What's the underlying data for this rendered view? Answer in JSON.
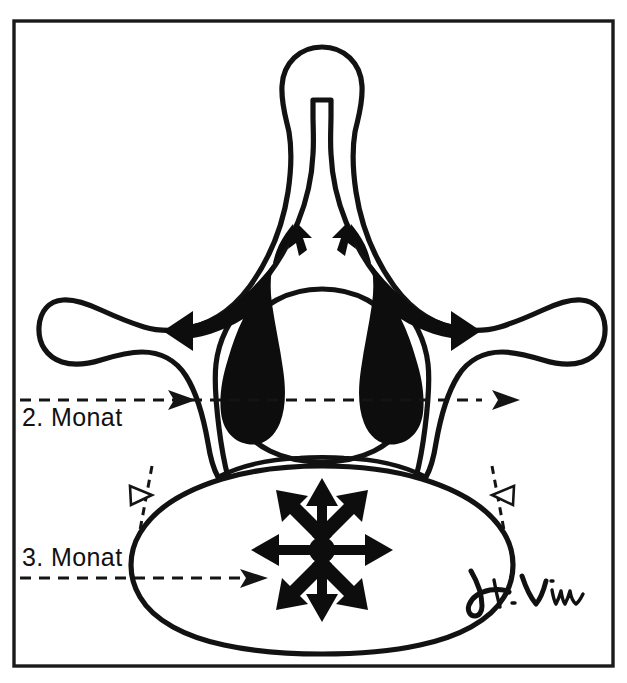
{
  "figure": {
    "type": "anatomical-line-drawing",
    "frame": {
      "visible": true,
      "color": "#1a1a1a"
    },
    "background_color": "#ffffff",
    "ink_color": "#0d0d0d"
  },
  "annotations": [
    {
      "id": "label-2-monat",
      "text": "2. Monat",
      "text_x": 22,
      "text_y": 418,
      "leader": {
        "style": "dashed",
        "y": 400,
        "x_start": 20,
        "x_end": 520,
        "head_positions": [
          195,
          520
        ],
        "head_style": "solid-arrow",
        "head_direction": "right"
      },
      "points_to": "neural-arch-ossification-centers"
    },
    {
      "id": "label-3-monat",
      "text": "3. Monat",
      "text_x": 22,
      "text_y": 560,
      "leader": {
        "style": "dashed",
        "y": 578,
        "x_start": 20,
        "x_end": 268,
        "head_positions": [
          268
        ],
        "head_style": "solid-arrow",
        "head_direction": "right"
      },
      "points_to": "vertebral-body-ossification-center"
    }
  ],
  "markers": [
    {
      "id": "open-triangle-left",
      "style": "open-triangle",
      "x": 137,
      "y": 497,
      "direction": "right"
    },
    {
      "id": "open-triangle-right",
      "style": "open-triangle",
      "x": 492,
      "y": 497,
      "direction": "left"
    }
  ],
  "ossification_centers": [
    {
      "id": "neural-arch-left",
      "color": "#0d0d0d",
      "month": "2. Monat"
    },
    {
      "id": "neural-arch-right",
      "color": "#0d0d0d",
      "month": "2. Monat"
    },
    {
      "id": "vertebral-body",
      "color": "#0d0d0d",
      "month": "3. Monat"
    }
  ],
  "growth_arrows": {
    "neural_arch_left": [
      "toward-spinous-process",
      "toward-transverse-process"
    ],
    "neural_arch_right": [
      "toward-spinous-process",
      "toward-transverse-process"
    ],
    "vertebral_body": {
      "pattern": "radial-starburst",
      "count": 8,
      "center_x": 322,
      "center_y": 550,
      "directions": [
        "N",
        "NE",
        "E",
        "SE",
        "S",
        "SW",
        "W",
        "NW"
      ]
    }
  },
  "signature": {
    "text": "H. Viau",
    "x": 470,
    "y": 600,
    "style": "handwritten-cursive"
  }
}
